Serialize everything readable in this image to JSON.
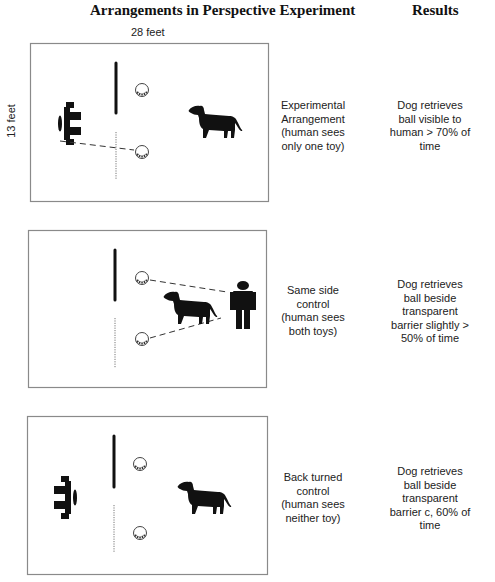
{
  "header": {
    "title": "Arrangements in Perspective Experiment",
    "results_title": "Results"
  },
  "dimensions": {
    "width_label": "28 feet",
    "height_label": "13 feet"
  },
  "rows": [
    {
      "condition": [
        "Experimental",
        "Arrangement",
        "(human sees",
        "only one toy)"
      ],
      "result": [
        "Dog retrieves",
        "ball visible to",
        "human > 70% of",
        "time"
      ],
      "human_pose": "human-facing-barrier-icon",
      "icons": [
        "barrier-opaque",
        "barrier-transparent",
        "ball-icon",
        "ball-icon",
        "human-topdown-icon",
        "dog-icon"
      ]
    },
    {
      "condition": [
        "Same side",
        "control",
        "(human sees",
        "both toys)"
      ],
      "result": [
        "Dog retrieves",
        "ball beside",
        "transparent",
        "barrier slightly >",
        "50% of time"
      ],
      "human_pose": "human-standing-icon",
      "icons": [
        "barrier-opaque",
        "barrier-transparent",
        "ball-icon",
        "ball-icon",
        "dog-icon",
        "human-standing-icon"
      ]
    },
    {
      "condition": [
        "Back turned",
        "control",
        "(human sees",
        "neither toy)"
      ],
      "result": [
        "Dog retrieves",
        "ball beside",
        "transparent",
        "barrier c, 60% of",
        "time"
      ],
      "human_pose": "human-back-turned-icon",
      "icons": [
        "barrier-opaque",
        "barrier-transparent",
        "ball-icon",
        "ball-icon",
        "human-topdown-icon",
        "dog-icon"
      ]
    }
  ],
  "colors": {
    "frame": "#8a8a8a",
    "ink": "#111111",
    "text": "#222222"
  }
}
